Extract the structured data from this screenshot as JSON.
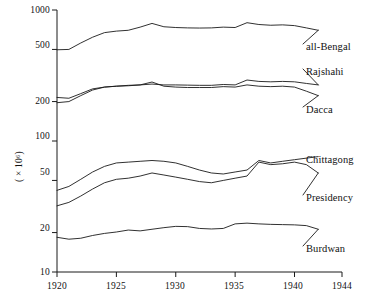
{
  "chart_data": {
    "type": "line",
    "title": "",
    "xlabel": "",
    "ylabel": "( × 10⁶)",
    "yscale": "log",
    "ylim": [
      10,
      1000
    ],
    "xlim": [
      1920,
      1944
    ],
    "grid": false,
    "legend_position": "right-inline",
    "y_ticks": [
      10,
      20,
      50,
      100,
      200,
      500,
      1000
    ],
    "y_tick_labels": [
      "10",
      "20",
      "50",
      "100",
      "200",
      "500",
      "1000"
    ],
    "x_ticks": [
      1920,
      1925,
      1930,
      1935,
      1940,
      1944
    ],
    "x_tick_labels": [
      "1920",
      "1925",
      "1930",
      "1935",
      "1940",
      "1944"
    ],
    "x": [
      1920,
      1921,
      1922,
      1923,
      1924,
      1925,
      1926,
      1927,
      1928,
      1929,
      1930,
      1931,
      1932,
      1933,
      1934,
      1935,
      1936,
      1937,
      1938,
      1939,
      1940,
      1941,
      1942
    ],
    "series": [
      {
        "name": "all-Bengal",
        "label": "all-Bengal",
        "color": "#1a1a1a",
        "values": [
          497,
          500,
          560,
          620,
          672,
          690,
          700,
          740,
          790,
          745,
          735,
          730,
          728,
          730,
          740,
          735,
          800,
          775,
          765,
          770,
          760,
          730,
          700
        ]
      },
      {
        "name": "Rajshahi",
        "label": "Rajshahi",
        "color": "#1a1a1a",
        "values": [
          196,
          200,
          222,
          245,
          258,
          262,
          266,
          268,
          272,
          268,
          268,
          267,
          266,
          266,
          270,
          268,
          292,
          285,
          283,
          285,
          283,
          275,
          268
        ]
      },
      {
        "name": "Dacca",
        "label": "Dacca",
        "color": "#1a1a1a",
        "values": [
          215,
          212,
          230,
          250,
          258,
          262,
          264,
          268,
          282,
          262,
          258,
          256,
          256,
          256,
          260,
          258,
          268,
          262,
          260,
          262,
          258,
          240,
          222
        ]
      },
      {
        "name": "Chittagong",
        "label": "Chittagong",
        "color": "#1a1a1a",
        "values": [
          42,
          45,
          51,
          58,
          64,
          68,
          69,
          70,
          71,
          70,
          68,
          64,
          60,
          57,
          56,
          58,
          60,
          71,
          68,
          70,
          72,
          74,
          76
        ]
      },
      {
        "name": "Presidency",
        "label": "Presidency",
        "color": "#1a1a1a",
        "values": [
          32,
          34,
          38,
          43,
          48,
          51,
          52,
          54,
          57,
          55,
          53,
          51,
          49,
          48,
          50,
          52,
          54,
          69,
          66,
          67,
          69,
          66,
          57
        ]
      },
      {
        "name": "Burdwan",
        "label": "Burdwan",
        "color": "#1a1a1a",
        "values": [
          18.4,
          17.8,
          18.1,
          19.0,
          19.7,
          20.2,
          20.9,
          20.6,
          21.2,
          21.8,
          22.3,
          22.2,
          21.5,
          21.3,
          21.5,
          23.3,
          23.6,
          23.3,
          23.1,
          23.0,
          22.9,
          22.6,
          21.2
        ]
      }
    ]
  },
  "labels": {
    "all_bengal": "all-Bengal",
    "rajshahi": "Rajshahi",
    "dacca": "Dacca",
    "chittagong": "Chittagong",
    "presidency": "Presidency",
    "burdwan": "Burdwan"
  },
  "axis": {
    "y_title": "( × 10⁶)",
    "y_1000": "1000",
    "y_500": "500",
    "y_200": "200",
    "y_100": "100",
    "y_50": "50",
    "y_20": "20",
    "y_10": "10",
    "x_1920": "1920",
    "x_1925": "1925",
    "x_1930": "1930",
    "x_1935": "1935",
    "x_1940": "1940",
    "x_1944": "1944"
  }
}
